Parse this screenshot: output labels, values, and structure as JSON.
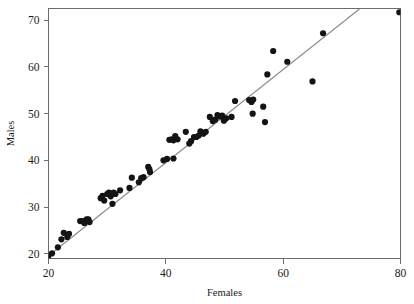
{
  "figure": {
    "background_color": "#ffffff",
    "width": 414,
    "height": 304
  },
  "axes": {
    "frame_color": "#6d6d6d",
    "x_axis": {
      "label": "Females",
      "tick_labels": [
        "20",
        "40",
        "60",
        "80"
      ],
      "tick_values": [
        20,
        40,
        60,
        80
      ],
      "range": [
        20,
        80
      ]
    },
    "y_axis": {
      "label": "Males",
      "tick_labels": [
        "20",
        "30",
        "40",
        "50",
        "60",
        "70"
      ],
      "tick_values": [
        20,
        30,
        40,
        50,
        60,
        70
      ],
      "range": [
        19.0,
        72.5
      ]
    }
  },
  "marker": {
    "color": "#141414",
    "radius": 3.1,
    "shape": "filled-circle"
  },
  "trendline": {
    "color": "#8a8a8a",
    "x_start": 20.0,
    "y_start": 19.6,
    "x_end": 73.0,
    "y_end": 72.4
  },
  "chart_data": {
    "type": "scatter",
    "title": "",
    "xlabel": "Females",
    "ylabel": "Males",
    "xlim": [
      20,
      80
    ],
    "ylim": [
      19.0,
      72.5
    ],
    "grid": false,
    "legend": null,
    "xticks": [
      20,
      40,
      60,
      80
    ],
    "yticks": [
      20,
      30,
      40,
      50,
      60,
      70
    ],
    "series": [
      {
        "name": "Life expectancy by country",
        "marker": "filled-circle",
        "color": "#141414",
        "points": [
          [
            20.0,
            19.6
          ],
          [
            20.6,
            20.1
          ],
          [
            21.6,
            21.4
          ],
          [
            22.2,
            23.1
          ],
          [
            22.6,
            24.5
          ],
          [
            23.2,
            23.6
          ],
          [
            23.5,
            24.3
          ],
          [
            25.4,
            27.0
          ],
          [
            25.8,
            27.0
          ],
          [
            26.1,
            26.6
          ],
          [
            26.5,
            27.4
          ],
          [
            26.8,
            27.4
          ],
          [
            27.0,
            26.8
          ],
          [
            28.9,
            31.9
          ],
          [
            29.2,
            32.4
          ],
          [
            29.5,
            31.4
          ],
          [
            30.0,
            32.8
          ],
          [
            30.3,
            33.1
          ],
          [
            30.6,
            32.3
          ],
          [
            30.9,
            30.7
          ],
          [
            31.1,
            33.1
          ],
          [
            31.4,
            32.8
          ],
          [
            32.2,
            33.6
          ],
          [
            33.8,
            34.1
          ],
          [
            34.2,
            36.3
          ],
          [
            35.4,
            35.3
          ],
          [
            35.8,
            36.2
          ],
          [
            36.2,
            36.4
          ],
          [
            37.0,
            38.6
          ],
          [
            37.2,
            38.1
          ],
          [
            37.3,
            37.5
          ],
          [
            39.6,
            40.0
          ],
          [
            40.2,
            40.3
          ],
          [
            41.3,
            40.4
          ],
          [
            40.6,
            44.4
          ],
          [
            41.0,
            44.5
          ],
          [
            41.3,
            44.3
          ],
          [
            41.6,
            45.2
          ],
          [
            42.0,
            44.5
          ],
          [
            43.4,
            46.1
          ],
          [
            44.0,
            43.6
          ],
          [
            44.3,
            44.1
          ],
          [
            44.8,
            45.0
          ],
          [
            45.2,
            45.0
          ],
          [
            45.6,
            45.3
          ],
          [
            45.9,
            46.2
          ],
          [
            46.4,
            45.7
          ],
          [
            46.8,
            46.1
          ],
          [
            47.5,
            49.3
          ],
          [
            48.0,
            48.4
          ],
          [
            48.4,
            48.7
          ],
          [
            48.8,
            49.7
          ],
          [
            49.1,
            49.4
          ],
          [
            49.6,
            49.6
          ],
          [
            49.9,
            48.5
          ],
          [
            50.3,
            49.0
          ],
          [
            51.2,
            49.3
          ],
          [
            51.8,
            52.7
          ],
          [
            54.2,
            52.9
          ],
          [
            54.6,
            52.5
          ],
          [
            54.9,
            53.0
          ],
          [
            54.8,
            50.0
          ],
          [
            56.6,
            51.5
          ],
          [
            56.9,
            48.2
          ],
          [
            57.3,
            58.4
          ],
          [
            58.3,
            63.4
          ],
          [
            60.7,
            61.1
          ],
          [
            65.0,
            56.9
          ],
          [
            66.8,
            67.2
          ],
          [
            79.8,
            71.7
          ]
        ]
      }
    ]
  }
}
